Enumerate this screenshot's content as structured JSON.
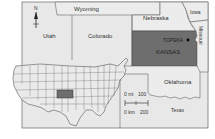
{
  "map": {
    "states": {
      "wyoming": "Wyoming",
      "nebraska": "Nebraska",
      "iowa": "Iowa",
      "utah": "Utah",
      "colorado": "Colorado",
      "kansas": "KANSAS",
      "missouri": "Missouri",
      "oklahoma": "Oklahoma",
      "texas": "Texas"
    },
    "capital": {
      "label": "TOPEKA",
      "state": "Kansas"
    },
    "north_arrow": {
      "label": "N"
    },
    "scale_bar": {
      "miles_label": "0 mi",
      "miles_value": "100",
      "km_label": "0 km",
      "km_value": "200"
    },
    "highlight_color": "#6e6e6e",
    "base_color": "#e6e6e6",
    "inset": {
      "description": "United States locator map with Kansas highlighted"
    }
  }
}
